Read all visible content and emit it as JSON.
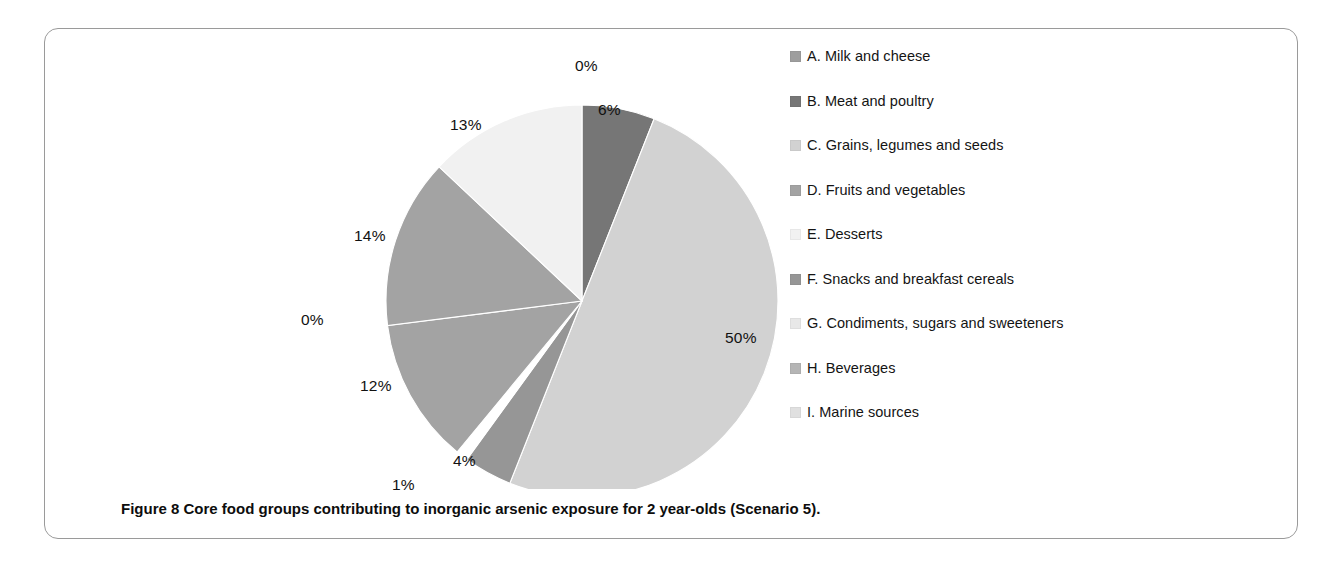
{
  "figure": {
    "caption_label": "Figure 8",
    "caption_text": "Core food groups contributing to inorganic arsenic exposure for 2 year-olds (Scenario 5)."
  },
  "legend": {
    "items": [
      {
        "key": "A",
        "label": "A. Milk and cheese",
        "color": "#9e9e9e"
      },
      {
        "key": "B",
        "label": "B. Meat and poultry",
        "color": "#767676"
      },
      {
        "key": "C",
        "label": "C. Grains, legumes and seeds",
        "color": "#d2d2d2"
      },
      {
        "key": "D",
        "label": "D. Fruits and vegetables",
        "color": "#a3a3a3"
      },
      {
        "key": "E",
        "label": "E. Desserts",
        "color": "#f1f1f1"
      },
      {
        "key": "F",
        "label": "F. Snacks and breakfast cereals",
        "color": "#969696"
      },
      {
        "key": "G",
        "label": "G. Condiments, sugars and sweeteners",
        "color": "#e8e8e8"
      },
      {
        "key": "H",
        "label": "H. Beverages",
        "color": "#b5b5b5"
      },
      {
        "key": "I",
        "label": "I. Marine sources",
        "color": "#e0e0e0"
      }
    ]
  },
  "chart_data": {
    "type": "pie",
    "title": "Core food groups contributing to inorganic arsenic exposure for 2 year-olds (Scenario 5)",
    "labels": [
      "A. Milk and cheese",
      "B. Meat and poultry",
      "C. Grains, legumes and seeds",
      "F. Snacks and breakfast cereals",
      "G. Condiments, sugars and sweeteners",
      "D. Fruits and vegetables",
      "H. Beverages",
      "E. Desserts",
      "I. Marine sources"
    ],
    "categories": [
      "A",
      "B",
      "C",
      "F",
      "G",
      "D",
      "H",
      "E",
      "I"
    ],
    "values": [
      0,
      6,
      50,
      4,
      1,
      12,
      14,
      13,
      0
    ],
    "value_labels": [
      "0%",
      "6%",
      "50%",
      "4%",
      "1%",
      "12%",
      "14%",
      "13%",
      "0%"
    ],
    "colors": [
      "#9e9e9e",
      "#767676",
      "#d2d2d2",
      "#969696",
      "#ffffff",
      "#a3a3a3",
      "#a3a3a3",
      "#f1f1f1",
      "#e0e0e0"
    ],
    "units": "percent",
    "start_angle_deg": 0,
    "direction": "clockwise",
    "legend_position": "right",
    "grid": false,
    "data_labels_shown": true
  },
  "pie_labels": [
    {
      "name": "label-a",
      "text": "0%",
      "x": 275,
      "y": 18
    },
    {
      "name": "label-b",
      "text": "6%",
      "x": 298,
      "y": 62
    },
    {
      "name": "label-c",
      "text": "50%",
      "x": 425,
      "y": 290
    },
    {
      "name": "label-f",
      "text": "4%",
      "x": 153,
      "y": 413
    },
    {
      "name": "label-g",
      "text": "1%",
      "x": 92,
      "y": 437
    },
    {
      "name": "label-d",
      "text": "12%",
      "x": 60,
      "y": 338
    },
    {
      "name": "label-h",
      "text": "14%",
      "x": 54,
      "y": 188
    },
    {
      "name": "label-e",
      "text": "13%",
      "x": 150,
      "y": 77
    },
    {
      "name": "label-i",
      "text": "0%",
      "x": 1,
      "y": 272
    }
  ]
}
